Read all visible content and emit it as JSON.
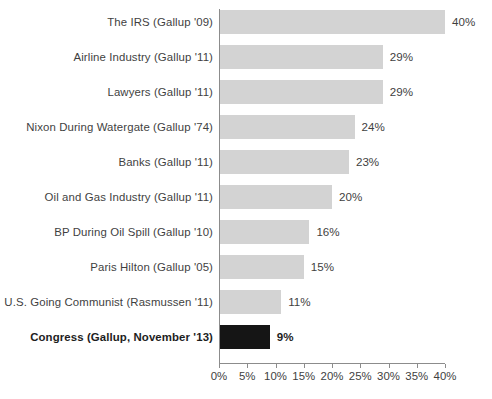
{
  "chart_data": {
    "type": "bar",
    "orientation": "horizontal",
    "title": "",
    "subtitle": "",
    "xlabel": "",
    "ylabel": "",
    "xlim": [
      0,
      40
    ],
    "grid": false,
    "legend": false,
    "value_suffix": "%",
    "tick_labels": [
      "0%",
      "5%",
      "10%",
      "15%",
      "20%",
      "25%",
      "30%",
      "35%",
      "40%"
    ],
    "tick_values": [
      0,
      5,
      10,
      15,
      20,
      25,
      30,
      35,
      40
    ],
    "colors": {
      "bar": "#d3d3d3",
      "bar_highlight": "#151515",
      "axis": "#8c8c8c",
      "text": "#3f3f3f",
      "background": "#ffffff"
    },
    "categories": [
      "The IRS (Gallup '09)",
      "Airline Industry (Gallup '11)",
      "Lawyers (Gallup '11)",
      "Nixon During Watergate (Gallup '74)",
      "Banks (Gallup '11)",
      "Oil and Gas Industry (Gallup '11)",
      "BP During Oil Spill (Gallup '10)",
      "Paris Hilton (Gallup '05)",
      "U.S. Going Communist (Rasmussen '11)",
      "Congress (Gallup, November '13)"
    ],
    "values": [
      40,
      29,
      29,
      24,
      23,
      20,
      16,
      15,
      11,
      9
    ],
    "value_labels": [
      "40%",
      "29%",
      "29%",
      "24%",
      "23%",
      "20%",
      "16%",
      "15%",
      "11%",
      "9%"
    ],
    "highlight_index": 9,
    "rows": [
      {
        "label": "The IRS (Gallup '09)",
        "value": 40,
        "value_label": "40%",
        "highlighted": false
      },
      {
        "label": "Airline Industry (Gallup '11)",
        "value": 29,
        "value_label": "29%",
        "highlighted": false
      },
      {
        "label": "Lawyers (Gallup '11)",
        "value": 29,
        "value_label": "29%",
        "highlighted": false
      },
      {
        "label": "Nixon During Watergate (Gallup '74)",
        "value": 24,
        "value_label": "24%",
        "highlighted": false
      },
      {
        "label": "Banks (Gallup '11)",
        "value": 23,
        "value_label": "23%",
        "highlighted": false
      },
      {
        "label": "Oil and Gas Industry (Gallup '11)",
        "value": 20,
        "value_label": "20%",
        "highlighted": false
      },
      {
        "label": "BP During Oil Spill (Gallup '10)",
        "value": 16,
        "value_label": "16%",
        "highlighted": false
      },
      {
        "label": "Paris Hilton (Gallup '05)",
        "value": 15,
        "value_label": "15%",
        "highlighted": false
      },
      {
        "label": "U.S. Going Communist (Rasmussen '11)",
        "value": 11,
        "value_label": "11%",
        "highlighted": false
      },
      {
        "label": "Congress (Gallup, November '13)",
        "value": 9,
        "value_label": "9%",
        "highlighted": true
      }
    ]
  }
}
